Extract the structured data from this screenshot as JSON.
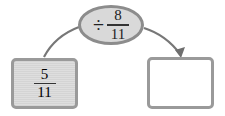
{
  "operation": {
    "operator": "÷",
    "numerator": "8",
    "denominator": "11"
  },
  "input_box": {
    "numerator": "5",
    "denominator": "11"
  },
  "output_box": {
    "value": ""
  },
  "colors": {
    "stroke": "#8c8c8c",
    "fill": "#d9d9d9",
    "arrow": "#6e6e6e"
  }
}
